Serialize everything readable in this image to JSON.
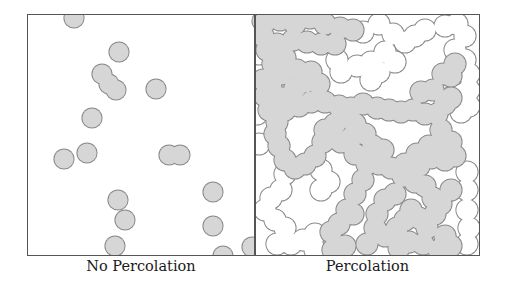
{
  "figure": {
    "panels": [
      {
        "caption": "No Percolation",
        "fill_color": "#d6d6d6",
        "stroke_color": "#8a8a8a",
        "radius": 10,
        "gray_discs": [
          [
            47,
            4
          ],
          [
            235,
            7
          ],
          [
            92,
            38
          ],
          [
            75,
            60
          ],
          [
            82,
            70
          ],
          [
            89,
            76
          ],
          [
            129,
            75
          ],
          [
            65,
            104
          ],
          [
            250,
            108
          ],
          [
            37,
            145
          ],
          [
            60,
            139
          ],
          [
            142,
            141
          ],
          [
            153,
            141
          ],
          [
            91,
            186
          ],
          [
            98,
            206
          ],
          [
            186,
            178
          ],
          [
            186,
            212
          ],
          [
            88,
            232
          ],
          [
            196,
            242
          ],
          [
            225,
            233
          ]
        ],
        "white_discs": []
      },
      {
        "caption": "Percolation",
        "fill_color": "#d6d6d6",
        "stroke_color": "#8a8a8a",
        "radius": 11,
        "gray_discs": [
          [
            10,
            8
          ],
          [
            25,
            6
          ],
          [
            40,
            10
          ],
          [
            55,
            4
          ],
          [
            70,
            10
          ],
          [
            85,
            14
          ],
          [
            98,
            16
          ],
          [
            8,
            22
          ],
          [
            12,
            36
          ],
          [
            22,
            30
          ],
          [
            38,
            26
          ],
          [
            52,
            28
          ],
          [
            66,
            30
          ],
          [
            80,
            30
          ],
          [
            30,
            44
          ],
          [
            18,
            50
          ],
          [
            26,
            60
          ],
          [
            42,
            56
          ],
          [
            56,
            58
          ],
          [
            8,
            66
          ],
          [
            10,
            82
          ],
          [
            14,
            96
          ],
          [
            22,
            108
          ],
          [
            30,
            96
          ],
          [
            44,
            92
          ],
          [
            56,
            88
          ],
          [
            70,
            88
          ],
          [
            84,
            92
          ],
          [
            96,
            94
          ],
          [
            108,
            90
          ],
          [
            122,
            94
          ],
          [
            134,
            96
          ],
          [
            146,
            98
          ],
          [
            158,
            96
          ],
          [
            170,
            100
          ],
          [
            182,
            100
          ],
          [
            190,
            90
          ],
          [
            196,
            84
          ],
          [
            186,
            116
          ],
          [
            16,
            74
          ],
          [
            28,
            84
          ],
          [
            40,
            74
          ],
          [
            50,
            68
          ],
          [
            64,
            70
          ],
          [
            20,
            120
          ],
          [
            24,
            132
          ],
          [
            30,
            146
          ],
          [
            40,
            154
          ],
          [
            50,
            150
          ],
          [
            60,
            142
          ],
          [
            68,
            128
          ],
          [
            76,
            124
          ],
          [
            86,
            128
          ],
          [
            96,
            124
          ],
          [
            110,
            120
          ],
          [
            118,
            132
          ],
          [
            128,
            136
          ],
          [
            124,
            150
          ],
          [
            90,
            100
          ],
          [
            100,
            110
          ],
          [
            80,
            110
          ],
          [
            70,
            116
          ],
          [
            100,
            140
          ],
          [
            112,
            150
          ],
          [
            108,
            166
          ],
          [
            100,
            180
          ],
          [
            92,
            196
          ],
          [
            84,
            210
          ],
          [
            76,
            218
          ],
          [
            98,
            200
          ],
          [
            136,
            154
          ],
          [
            148,
            162
          ],
          [
            150,
            150
          ],
          [
            162,
            140
          ],
          [
            174,
            132
          ],
          [
            186,
            134
          ],
          [
            196,
            128
          ],
          [
            200,
            142
          ],
          [
            190,
            146
          ],
          [
            176,
            144
          ],
          [
            164,
            152
          ],
          [
            160,
            168
          ],
          [
            170,
            172
          ],
          [
            178,
            184
          ],
          [
            186,
            190
          ],
          [
            196,
            176
          ],
          [
            140,
            180
          ],
          [
            130,
            186
          ],
          [
            122,
            200
          ],
          [
            120,
            214
          ],
          [
            130,
            222
          ],
          [
            142,
            214
          ],
          [
            150,
            206
          ],
          [
            156,
            196
          ],
          [
            164,
            204
          ],
          [
            172,
            214
          ],
          [
            180,
            200
          ],
          [
            190,
            222
          ],
          [
            196,
            232
          ],
          [
            184,
            236
          ],
          [
            168,
            230
          ],
          [
            154,
            228
          ],
          [
            144,
            234
          ],
          [
            166,
            78
          ],
          [
            178,
            76
          ],
          [
            196,
            62
          ],
          [
            200,
            50
          ],
          [
            188,
            60
          ],
          [
            112,
            230
          ],
          [
            90,
            232
          ],
          [
            78,
            236
          ]
        ],
        "white_discs": [
          [
            108,
            18
          ],
          [
            124,
            10
          ],
          [
            138,
            20
          ],
          [
            150,
            28
          ],
          [
            160,
            22
          ],
          [
            170,
            16
          ],
          [
            190,
            12
          ],
          [
            202,
            10
          ],
          [
            210,
            22
          ],
          [
            200,
            36
          ],
          [
            210,
            46
          ],
          [
            214,
            60
          ],
          [
            82,
            46
          ],
          [
            86,
            58
          ],
          [
            102,
            52
          ],
          [
            116,
            48
          ],
          [
            124,
            58
          ],
          [
            116,
            66
          ],
          [
            130,
            38
          ],
          [
            140,
            48
          ],
          [
            200,
            80
          ],
          [
            214,
            76
          ],
          [
            214,
            92
          ],
          [
            206,
            98
          ],
          [
            30,
            160
          ],
          [
            26,
            176
          ],
          [
            16,
            184
          ],
          [
            10,
            196
          ],
          [
            20,
            206
          ],
          [
            30,
            214
          ],
          [
            22,
            230
          ],
          [
            36,
            230
          ],
          [
            48,
            226
          ],
          [
            60,
            220
          ],
          [
            60,
            236
          ],
          [
            66,
            156
          ],
          [
            74,
            168
          ],
          [
            66,
            176
          ],
          [
            212,
            158
          ],
          [
            212,
            176
          ],
          [
            212,
            196
          ],
          [
            214,
            214
          ],
          [
            212,
            230
          ],
          [
            4,
            130
          ],
          [
            2,
            100
          ],
          [
            4,
            40
          ]
        ]
      }
    ]
  }
}
